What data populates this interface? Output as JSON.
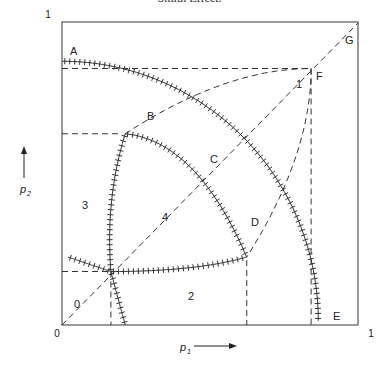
{
  "caption": "Smith Effect.",
  "chart_data": {
    "type": "diagram",
    "title": "",
    "xlabel": "p1",
    "ylabel": "p2",
    "xlim": [
      0,
      1
    ],
    "ylim": [
      0,
      1
    ],
    "x_ticks": [
      "0",
      "0.15",
      "0.2",
      "0.625",
      "0.85",
      "0.875",
      "1"
    ],
    "y_ticks": [
      "0.15",
      "0.2",
      "0.625",
      "0.85",
      "0.875",
      "1"
    ],
    "points": [
      {
        "name": "A",
        "x": 0,
        "y": 0.875
      },
      {
        "name": "B",
        "x": 0.2,
        "y": 0.625
      },
      {
        "name": "C",
        "x": 0.5,
        "y": 0.5
      },
      {
        "name": "D",
        "x": 0.625,
        "y": 0.2
      },
      {
        "name": "E",
        "x": 0.875,
        "y": 0
      },
      {
        "name": "F",
        "x": 0.85,
        "y": 0.85
      },
      {
        "name": "G",
        "x": 1,
        "y": 1
      }
    ],
    "regions": [
      "0",
      "1",
      "2",
      "3",
      "4"
    ],
    "curves": [
      {
        "name": "hatched-arc-A-B-C-D-E",
        "style": "hatched",
        "from": "A",
        "to": "E"
      },
      {
        "name": "hatched-curve-0.2y-to-D",
        "style": "hatched",
        "from": [
          0,
          0.2
        ],
        "to": "D"
      },
      {
        "name": "hatched-curve-B-to-0.2x",
        "style": "hatched",
        "from": "B",
        "to": [
          0.2,
          0
        ]
      },
      {
        "name": "dashed-curve-B-F-D",
        "style": "dashed"
      },
      {
        "name": "diagonal-0-G",
        "style": "dashed"
      }
    ],
    "reference_lines": [
      {
        "orientation": "h",
        "value": 0.85,
        "to_x": 0.85
      },
      {
        "orientation": "v",
        "value": 0.85,
        "to_y": 0.85
      },
      {
        "orientation": "h",
        "value": 0.625,
        "to_x": 0.2
      },
      {
        "orientation": "v",
        "value": 0.625,
        "to_y": 0.2
      },
      {
        "orientation": "h",
        "value": 0.15,
        "to_x": 0.15
      },
      {
        "orientation": "v",
        "value": 0.15,
        "to_y": 0.15
      }
    ]
  },
  "axis": {
    "x_title": "p",
    "x_sub": "1",
    "y_title": "p",
    "y_sub": "2",
    "x_labels": {
      "0": "0",
      "0.15": "0.15",
      "0.2": "0.2",
      "0.625": "0.625",
      "0.85": "0.85",
      "0.875": "0.875",
      "1": "1"
    },
    "y_labels": {
      "1": "1",
      "0.875": "0.875",
      "0.85": "0.85",
      "0.625": "0.625",
      "0.2": "0.2",
      "0.15": "0.15"
    }
  },
  "labels": {
    "A": "A",
    "B": "B",
    "C": "C",
    "D": "D",
    "E": "E",
    "F": "F",
    "G": "G",
    "r0": "0",
    "r1": "1",
    "r2": "2",
    "r3": "3",
    "r4": "4"
  }
}
